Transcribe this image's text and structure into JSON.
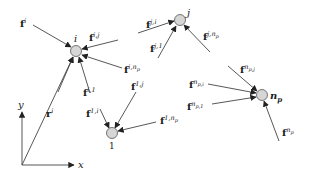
{
  "diagram": {
    "type": "force-diagram",
    "colors": {
      "line": "#444444",
      "node_fill": "#d6d6d6",
      "node_stroke": "#555555",
      "text": "#1a1a1a"
    },
    "axes": {
      "origin": [
        22,
        165
      ],
      "x_end": [
        76,
        165
      ],
      "y_end": [
        22,
        110
      ],
      "x_label": "x",
      "y_label": "y",
      "position_vector": {
        "label_base": "r",
        "label_sup": "i",
        "to_node": "i"
      }
    },
    "nodes": [
      {
        "id": "i",
        "label": "i",
        "x": 76,
        "y": 51
      },
      {
        "id": "j",
        "label": "j",
        "x": 180,
        "y": 20
      },
      {
        "id": "1",
        "label": "1",
        "x": 112,
        "y": 133
      },
      {
        "id": "np",
        "label": "n",
        "label_sub": "p",
        "x": 262,
        "y": 95
      }
    ],
    "forces": [
      {
        "node": "i",
        "base": "f",
        "sup": "i",
        "from": [
          33,
          25
        ],
        "lx": 20,
        "ly": 24
      },
      {
        "node": "i",
        "base": "f",
        "sup": "i,j",
        "from": [
          118,
          40
        ],
        "lx": 89,
        "ly": 45
      },
      {
        "node": "i",
        "base": "f",
        "sup": "i,n",
        "sup_sub": "p",
        "from": [
          122,
          68
        ],
        "lx": 124,
        "ly": 70
      },
      {
        "node": "i",
        "base": "f",
        "sup": "",
        "from": [
          58,
          92
        ],
        "lx": 0,
        "ly": 0,
        "hidden_label": true
      },
      {
        "node": "i",
        "base": "f",
        "sup": "i,1",
        "from": [
          90,
          93
        ],
        "lx": 80,
        "ly": 95
      },
      {
        "node": "j",
        "base": "f",
        "sup": "j,i",
        "from": [
          138,
          33
        ],
        "lx": 146,
        "ly": 27
      },
      {
        "node": "j",
        "base": "f",
        "sup": "j,1",
        "from": [
          158,
          58
        ],
        "lx": 152,
        "ly": 52
      },
      {
        "node": "j",
        "base": "f",
        "sup": "j,n",
        "sup_sub": "p",
        "from": [
          210,
          52
        ],
        "lx": 207,
        "ly": 39
      },
      {
        "node": "1",
        "base": "f",
        "sup": "1,i",
        "from": [
          100,
          109
        ],
        "lx": 84,
        "ly": 117
      },
      {
        "node": "1",
        "base": "f",
        "sup": "1,j",
        "from": [
          136,
          92
        ],
        "lx": 130,
        "ly": 88
      },
      {
        "node": "1",
        "base": "f",
        "sup": "1,n",
        "sup_sub": "p",
        "from": [
          156,
          122
        ],
        "lx": 164,
        "ly": 120
      },
      {
        "node": "np",
        "base": "f",
        "sup": "n",
        "sup_sub": "p,j",
        "from": [
          228,
          66
        ],
        "lx": 245,
        "ly": 72
      },
      {
        "node": "np",
        "base": "f",
        "sup": "n",
        "sup_sub": "p,i",
        "from": [
          208,
          84
        ],
        "lx": 190,
        "ly": 87
      },
      {
        "node": "np",
        "base": "f",
        "sup": "n",
        "sup_sub": "p,1",
        "from": [
          212,
          104
        ],
        "lx": 187,
        "ly": 108
      },
      {
        "node": "np",
        "base": "f",
        "sup": "n",
        "sup_sub": "p",
        "from": [
          279,
          141
        ],
        "lx": 281,
        "ly": 135
      }
    ]
  }
}
